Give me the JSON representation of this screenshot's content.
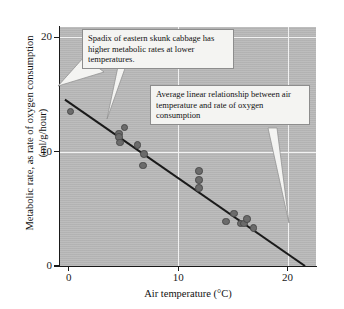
{
  "chart_data": {
    "type": "scatter",
    "title": "",
    "xlabel": "Air temperature (°C)",
    "ylabel": "Metabolic rate, as rate of oxygen consumption (ml/g/hour)",
    "xlim": [
      -0.8,
      22.6
    ],
    "ylim": [
      0,
      20.9
    ],
    "xticks": [
      0,
      10,
      20
    ],
    "yticks": [
      0,
      10,
      20
    ],
    "xtick_labels": [
      "0",
      "10",
      "20"
    ],
    "ytick_labels": [
      "0",
      "10",
      "20"
    ],
    "grid": "white gridlines at x=10, x=20 and y=10, y=20",
    "legend": "none",
    "points": [
      {
        "x": 0.15,
        "y": 13.5
      },
      {
        "x": 4.6,
        "y": 11.6
      },
      {
        "x": 4.6,
        "y": 11.3
      },
      {
        "x": 4.7,
        "y": 10.8
      },
      {
        "x": 5.1,
        "y": 12.1
      },
      {
        "x": 6.3,
        "y": 10.6
      },
      {
        "x": 6.9,
        "y": 9.8
      },
      {
        "x": 6.8,
        "y": 8.8
      },
      {
        "x": 11.9,
        "y": 8.3
      },
      {
        "x": 11.9,
        "y": 7.5
      },
      {
        "x": 11.9,
        "y": 6.8
      },
      {
        "x": 14.4,
        "y": 3.9
      },
      {
        "x": 15.1,
        "y": 4.6
      },
      {
        "x": 15.7,
        "y": 3.7
      },
      {
        "x": 16.0,
        "y": 3.7
      },
      {
        "x": 16.3,
        "y": 4.1
      },
      {
        "x": 16.9,
        "y": 3.3
      }
    ],
    "regression_line": {
      "x_start": -0.35,
      "y_start": 14.55,
      "x_end": 21.6,
      "y_end": 0.0,
      "description": "Average linear relationship between air temperature and rate of oxygen consumption"
    },
    "series_color": "#6b6b6b",
    "line_color": "#1a1a1a",
    "plot_background": "#b9b9b9"
  },
  "annotations": {
    "callout_1": {
      "text": "Spadix of eastern skunk cabbage has higher metabolic rates at lower temperatures."
    },
    "callout_2": {
      "text": "Average linear relationship between air temperature and rate of oxygen consumption"
    }
  }
}
